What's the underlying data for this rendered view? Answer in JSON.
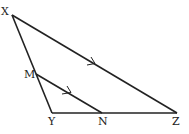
{
  "diagram": {
    "type": "geometry-triangle",
    "vertices": {
      "X": {
        "label": "X",
        "x": 12,
        "y": 15
      },
      "M": {
        "label": "M",
        "x": 36,
        "y": 74
      },
      "Y": {
        "label": "Y",
        "x": 52,
        "y": 113
      },
      "N": {
        "label": "N",
        "x": 102,
        "y": 113
      },
      "Z": {
        "label": "Z",
        "x": 177,
        "y": 113
      }
    },
    "segments": [
      "XY",
      "YZ",
      "XZ",
      "MN"
    ],
    "parallel_marks": [
      "XZ",
      "MN"
    ],
    "stroke_color": "#222222"
  }
}
